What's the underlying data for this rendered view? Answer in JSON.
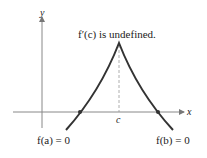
{
  "diagram": {
    "title": "f′(c) is undefined.",
    "axes": {
      "x_label": "x",
      "y_label": "y"
    },
    "points": {
      "c_label": "c"
    },
    "annotations": {
      "left_root": "f(a) = 0",
      "right_root": "f(b) = 0"
    },
    "colors": {
      "curve": "#333333",
      "axis": "#777777",
      "dashed": "#888888",
      "text": "#222222"
    }
  }
}
